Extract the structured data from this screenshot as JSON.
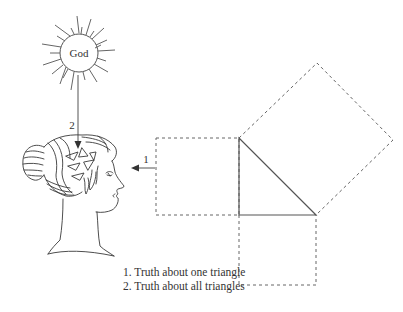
{
  "diagram": {
    "sun": {
      "label": "God"
    },
    "arrows": [
      {
        "id": "1",
        "label": "1",
        "from": "triangle",
        "to": "head"
      },
      {
        "id": "2",
        "label": "2",
        "from": "God",
        "to": "head"
      }
    ],
    "caption": {
      "items": [
        "1. Truth about one triangle",
        "2. Truth about all triangles"
      ]
    },
    "figures": {
      "head": "classical-profile-head",
      "triangle": "right-triangle",
      "squares": [
        "left-square",
        "bottom-square",
        "hypotenuse-square"
      ]
    },
    "colors": {
      "line": "#555555",
      "dashed": "#666666",
      "background": "#ffffff"
    }
  }
}
